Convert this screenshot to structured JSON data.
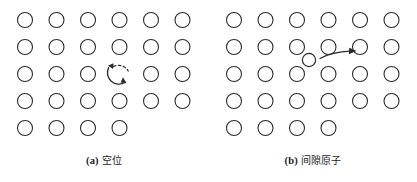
{
  "figure": {
    "type": "diagram",
    "background_color": "#ffffff",
    "stroke_color": "#2b2b2b",
    "panels": [
      {
        "id": "a",
        "tag": "(a)",
        "caption_cn": "空位",
        "caption_full": "(a) 空位",
        "defect_type": "vacancy",
        "lattice": {
          "columns": 6,
          "rows": 5,
          "col_spacing": 31.5,
          "row_spacing": 27,
          "origin_x": 25,
          "origin_y": 20,
          "circle_radius": 7.5,
          "missing_sites": [
            {
              "row": 5,
              "col": 5
            },
            {
              "row": 5,
              "col": 6
            },
            {
              "row": 3,
              "col": 4
            }
          ]
        },
        "vacancy_marker": {
          "row": 3,
          "col": 4,
          "style": "dashed-circle-with-curved-arrows",
          "arrows": 2,
          "upper_arrow_direction": "left",
          "lower_arrow_direction": "right"
        }
      },
      {
        "id": "b",
        "tag": "(b)",
        "caption_cn": "间隙原子",
        "caption_full": "(b) 间隙原子",
        "defect_type": "interstitial-atom",
        "lattice": {
          "columns": 6,
          "rows": 5,
          "col_spacing": 31.5,
          "row_spacing": 27,
          "origin_x": 25,
          "origin_y": 20,
          "circle_radius": 7.5,
          "missing_sites": [
            {
              "row": 5,
              "col": 5
            },
            {
              "row": 5,
              "col": 6
            }
          ]
        },
        "interstitial": {
          "x": 95,
          "y": 60,
          "radius": 6.5,
          "label": "interstitial-atom"
        },
        "motion_arrow": {
          "direction": "right",
          "from_x": 108,
          "to_x": 143,
          "y": 55,
          "style": "curved-solid"
        }
      }
    ]
  }
}
